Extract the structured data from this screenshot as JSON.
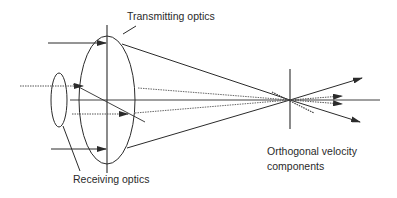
{
  "diagram": {
    "labels": {
      "transmitting": "Transmitting optics",
      "receiving": "Receiving optics",
      "velocity_line1": "Orthogonal velocity",
      "velocity_line2": "components"
    },
    "colors": {
      "line": "#2b2b2b",
      "dotted": "#555555",
      "text": "#2a2a2a",
      "background": "#ffffff"
    }
  }
}
